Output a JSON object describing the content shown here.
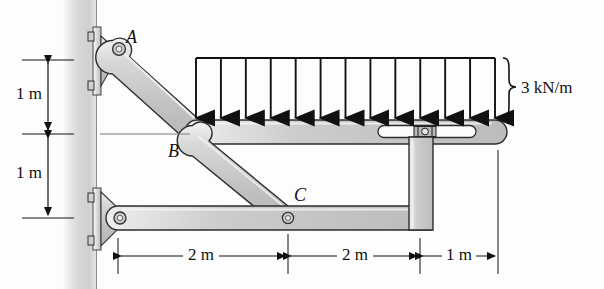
{
  "figure": {
    "background_color": "#fdfdfd",
    "ink_color": "#111111",
    "member_fill": "#c9c9c9",
    "member_fill_light": "#e2e2e2",
    "wall_fill": "#d2d2d2"
  },
  "labels": {
    "point_a": "A",
    "point_b": "B",
    "point_c": "C"
  },
  "load": {
    "magnitude_text": "3 kN/m",
    "value": 3,
    "units": "kN/m",
    "type": "uniformly-distributed-load",
    "direction": "downward",
    "arrow_count": 13,
    "span_start_x": 196,
    "span_end_x": 495
  },
  "dimensions": {
    "vertical": [
      {
        "label": "1 m",
        "value": 1,
        "units": "m",
        "from_y": 60,
        "to_y": 134
      },
      {
        "label": "1 m",
        "value": 1,
        "units": "m",
        "from_y": 134,
        "to_y": 218
      }
    ],
    "horizontal": [
      {
        "label": "2 m",
        "value": 2,
        "units": "m",
        "from_x": 118,
        "to_x": 288
      },
      {
        "label": "2 m",
        "value": 2,
        "units": "m",
        "from_x": 288,
        "to_x": 420
      },
      {
        "label": "1 m",
        "value": 1,
        "units": "m",
        "from_x": 420,
        "to_x": 498
      }
    ]
  },
  "geometry": {
    "wall_x_left": 62,
    "wall_x_right": 97,
    "pin_a_top": {
      "x": 118,
      "y": 48
    },
    "pin_b": {
      "x": 197,
      "y": 134
    },
    "pin_c": {
      "x": 288,
      "y": 218
    },
    "pin_lower_wall": {
      "x": 118,
      "y": 218
    },
    "top_beam_y": 132,
    "bottom_beam_y": 218,
    "right_column_x": 420,
    "slot_center": {
      "x": 455,
      "y": 131
    }
  }
}
